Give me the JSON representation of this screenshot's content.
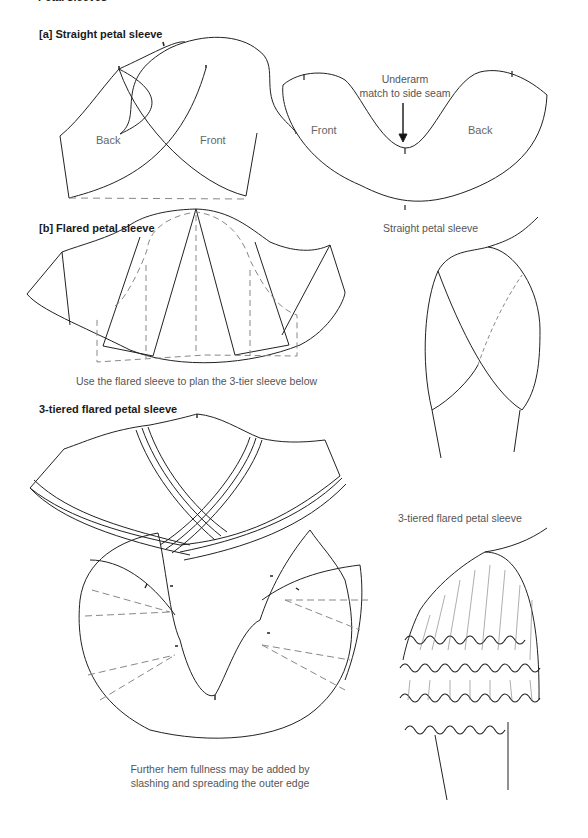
{
  "page": {
    "title": "Petal sleeves"
  },
  "section_a": {
    "heading": "[a] Straight petal sleeve",
    "left_pattern": {
      "back_label": "Back",
      "front_label": "Front"
    },
    "right_pattern": {
      "front_label": "Front",
      "back_label": "Back",
      "annotation_line1": "Underarm",
      "annotation_line2": "match to side seam"
    },
    "illustration_caption": "Straight petal sleeve"
  },
  "section_b": {
    "heading": "[b] Flared petal sleeve",
    "caption": "Use the flared sleeve to plan the 3-tier sleeve below"
  },
  "section_c": {
    "heading": "3-tiered flared petal sleeve",
    "illustration_caption": "3-tiered flared petal sleeve",
    "caption_line1": "Further hem fullness may be added by",
    "caption_line2": "slashing and spreading the outer edge"
  },
  "colors": {
    "line": "#222222",
    "dashed": "#888888",
    "text": "#555555"
  }
}
